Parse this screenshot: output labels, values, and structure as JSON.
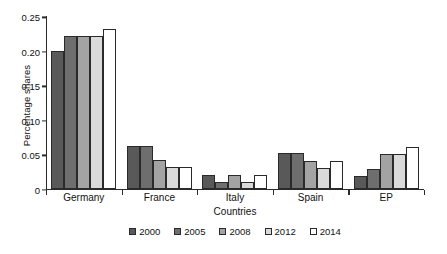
{
  "chart_data": {
    "type": "bar",
    "title": "",
    "xlabel": "Countries",
    "ylabel": "Percentage shares",
    "categories": [
      "Germany",
      "France",
      "Italy",
      "Spain",
      "EP"
    ],
    "ylim": [
      0,
      0.25
    ],
    "yticks": [
      "0",
      "0.05",
      "0.10",
      "0.15",
      "0.20",
      "0.25"
    ],
    "ytick_values": [
      0,
      0.05,
      0.1,
      0.15,
      0.2,
      0.25
    ],
    "grid": false,
    "legend_position": "bottom",
    "series": [
      {
        "name": "2000",
        "color": "#595959",
        "values": [
          0.2,
          0.062,
          0.02,
          0.051,
          0.019
        ]
      },
      {
        "name": "2005",
        "color": "#6e6e6e",
        "values": [
          0.221,
          0.062,
          0.01,
          0.051,
          0.029
        ]
      },
      {
        "name": "2008",
        "color": "#a3a3a3",
        "values": [
          0.221,
          0.042,
          0.02,
          0.04,
          0.05
        ]
      },
      {
        "name": "2012",
        "color": "#dadada",
        "values": [
          0.221,
          0.031,
          0.009,
          0.03,
          0.05
        ]
      },
      {
        "name": "2014",
        "color": "#ffffff",
        "values": [
          0.231,
          0.031,
          0.02,
          0.04,
          0.061
        ]
      }
    ]
  }
}
